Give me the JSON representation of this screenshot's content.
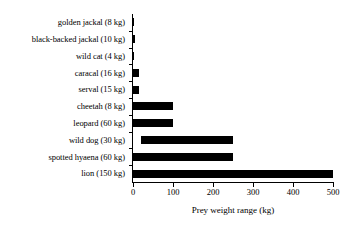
{
  "chart_data": {
    "type": "bar",
    "orientation": "horizontal",
    "title": "",
    "xlabel": "Prey weight range (kg)",
    "ylabel": "",
    "xlim": [
      0,
      500
    ],
    "xticks": [
      0,
      100,
      200,
      300,
      400,
      500
    ],
    "xticklabels": [
      "0",
      "100",
      "200",
      "300",
      "400",
      "500"
    ],
    "grid": false,
    "legend": null,
    "bar_color": "#000000",
    "background_color": "#ffffff",
    "note": "Each bar spans the prey weight range (min to max) taken by the predator; the predator body mass is given in parentheses in the category label.",
    "categories": [
      "golden jackal (8 kg)",
      "black-backed jackal (10 kg)",
      "wild cat (4 kg)",
      "caracal (16 kg)",
      "serval (15 kg)",
      "cheetah (8 kg)",
      "leopard (60 kg)",
      "wild dog (30 kg)",
      "spotted hyaena (60 kg)",
      "lion (150 kg)"
    ],
    "ranges": [
      {
        "category": "golden jackal (8 kg)",
        "start": 0,
        "end": 3,
        "predator_mass_kg": 8
      },
      {
        "category": "black-backed jackal (10 kg)",
        "start": 0,
        "end": 4,
        "predator_mass_kg": 10
      },
      {
        "category": "wild cat (4 kg)",
        "start": 0,
        "end": 3,
        "predator_mass_kg": 4
      },
      {
        "category": "caracal (16 kg)",
        "start": 0,
        "end": 16,
        "predator_mass_kg": 16
      },
      {
        "category": "serval (15 kg)",
        "start": 0,
        "end": 16,
        "predator_mass_kg": 15
      },
      {
        "category": "cheetah (8 kg)",
        "start": 0,
        "end": 100,
        "predator_mass_kg": 8
      },
      {
        "category": "leopard (60 kg)",
        "start": 0,
        "end": 100,
        "predator_mass_kg": 60
      },
      {
        "category": "wild dog (30 kg)",
        "start": 20,
        "end": 250,
        "predator_mass_kg": 30
      },
      {
        "category": "spotted hyaena (60 kg)",
        "start": 0,
        "end": 250,
        "predator_mass_kg": 60
      },
      {
        "category": "lion (150 kg)",
        "start": 0,
        "end": 500,
        "predator_mass_kg": 150
      }
    ],
    "values": [
      3,
      4,
      3,
      16,
      16,
      100,
      100,
      230,
      250,
      500
    ]
  }
}
